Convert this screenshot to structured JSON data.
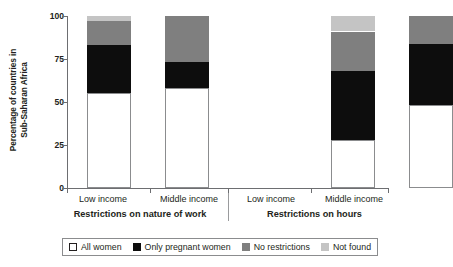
{
  "chart_data": {
    "type": "bar",
    "stacked": true,
    "title": "",
    "xlabel": "",
    "ylabel_line1": "Percentage of countries in",
    "ylabel_line2": "Sub-Saharan Africa",
    "ylim": [
      0,
      100
    ],
    "yticks": [
      0,
      25,
      50,
      75,
      100
    ],
    "ytick_labels": [
      "0",
      "25",
      "50",
      "75",
      "100"
    ],
    "grid": false,
    "legend_position": "bottom",
    "categories": [
      "Low income",
      "Middle income",
      "Low income",
      "Middle income"
    ],
    "groups": [
      {
        "label": "Restrictions on nature of work",
        "categories": [
          "Low income",
          "Middle income"
        ]
      },
      {
        "label": "Restrictions on hours",
        "categories": [
          "Low income",
          "Middle income"
        ]
      }
    ],
    "series": [
      {
        "name": "All women",
        "color": "#ffffff",
        "values": [
          55,
          58,
          28,
          48
        ]
      },
      {
        "name": "Only pregnant women",
        "color": "#0d0d0d",
        "values": [
          28,
          15,
          40,
          36
        ]
      },
      {
        "name": "No restrictions",
        "color": "#7f7f7f",
        "values": [
          14,
          27,
          23,
          16
        ]
      },
      {
        "name": "Not found",
        "color": "#c4c4c4",
        "values": [
          3,
          0,
          9,
          0
        ]
      }
    ],
    "bars": [
      {
        "group": "Restrictions on nature of work",
        "category": "Low income",
        "segments": [
          {
            "name": "All women",
            "value": 55,
            "from": 0,
            "to": 55
          },
          {
            "name": "Only pregnant women",
            "value": 28,
            "from": 55,
            "to": 83
          },
          {
            "name": "No restrictions",
            "value": 14,
            "from": 83,
            "to": 97
          },
          {
            "name": "Not found",
            "value": 3,
            "from": 97,
            "to": 100
          }
        ]
      },
      {
        "group": "Restrictions on nature of work",
        "category": "Middle income",
        "segments": [
          {
            "name": "All women",
            "value": 58,
            "from": 0,
            "to": 58
          },
          {
            "name": "Only pregnant women",
            "value": 15,
            "from": 58,
            "to": 73
          },
          {
            "name": "No restrictions",
            "value": 27,
            "from": 73,
            "to": 100
          },
          {
            "name": "Not found",
            "value": 0,
            "from": 100,
            "to": 100
          }
        ]
      },
      {
        "group": "Restrictions on hours",
        "category": "Low income",
        "segments": [
          {
            "name": "All women",
            "value": 28,
            "from": 0,
            "to": 28
          },
          {
            "name": "Only pregnant women",
            "value": 40,
            "from": 28,
            "to": 68
          },
          {
            "name": "No restrictions",
            "value": 23,
            "from": 68,
            "to": 91
          },
          {
            "name": "Not found",
            "value": 9,
            "from": 91,
            "to": 100
          }
        ]
      },
      {
        "group": "Restrictions on hours",
        "category": "Middle income",
        "segments": [
          {
            "name": "All women",
            "value": 48,
            "from": 0,
            "to": 48
          },
          {
            "name": "Only pregnant women",
            "value": 36,
            "from": 48,
            "to": 84
          },
          {
            "name": "No restrictions",
            "value": 16,
            "from": 84,
            "to": 100
          },
          {
            "name": "Not found",
            "value": 0,
            "from": 100,
            "to": 100
          }
        ]
      }
    ]
  },
  "axis": {
    "y_title_line1": "Percentage of countries in",
    "y_title_line2": "Sub-Saharan Africa",
    "ticks": [
      "100",
      "75",
      "50",
      "25",
      "0"
    ]
  },
  "xaxis": {
    "cat_labels": [
      "Low income",
      "Middle income",
      "Low income",
      "Middle income"
    ],
    "group_labels": [
      "Restrictions on nature of work",
      "Restrictions on hours"
    ]
  },
  "legend": {
    "items": [
      {
        "label": "All women",
        "swatch": "c-all"
      },
      {
        "label": "Only pregnant women",
        "swatch": "c-pregnant"
      },
      {
        "label": "No restrictions",
        "swatch": "c-norestr"
      },
      {
        "label": "Not found",
        "swatch": "c-notfound"
      }
    ]
  }
}
